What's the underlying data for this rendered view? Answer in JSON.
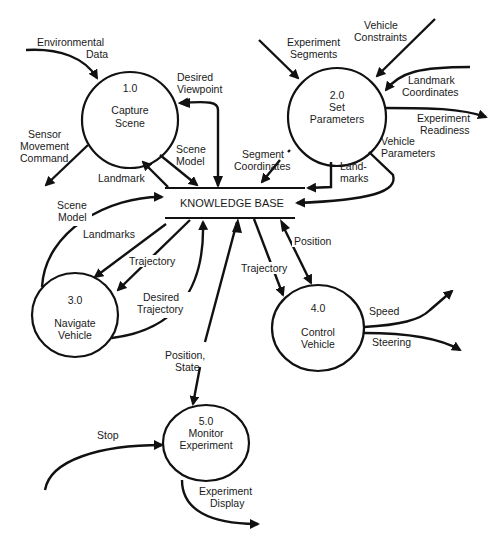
{
  "diagram": {
    "type": "data-flow-diagram",
    "colors": {
      "line": "#111111",
      "background": "#ffffff",
      "text": "#1a1a1a"
    },
    "data_store": {
      "label": "KNOWLEDGE BASE"
    },
    "processes": [
      {
        "id": "1.0",
        "name_line1": "Capture",
        "name_line2": "Scene"
      },
      {
        "id": "2.0",
        "name_line1": "Set",
        "name_line2": "Parameters"
      },
      {
        "id": "3.0",
        "name_line1": "Navigate",
        "name_line2": "Vehicle"
      },
      {
        "id": "4.0",
        "name_line1": "Control",
        "name_line2": "Vehicle"
      },
      {
        "id": "5.0",
        "name_line1": "Monitor",
        "name_line2": "Experiment"
      }
    ],
    "flows": {
      "environmental_data": {
        "l1": "Environmental",
        "l2": "Data"
      },
      "desired_viewpoint": {
        "l1": "Desired",
        "l2": "Viewpoint"
      },
      "sensor_movement_command": {
        "l1": "Sensor",
        "l2": "Movement",
        "l3": "Command"
      },
      "scene_model_1": {
        "l1": "Scene",
        "l2": "Model"
      },
      "landmark": {
        "l1": "Landmark"
      },
      "segment_coordinates": {
        "l1": "Segment",
        "l2": "Coordinates"
      },
      "experiment_segments": {
        "l1": "Experiment",
        "l2": "Segments"
      },
      "vehicle_constraints": {
        "l1": "Vehicle",
        "l2": "Constraints"
      },
      "landmark_coordinates": {
        "l1": "Landmark",
        "l2": "Coordinates"
      },
      "experiment_readiness": {
        "l1": "Experiment",
        "l2": "Readiness"
      },
      "vehicle_parameters": {
        "l1": "Vehicle",
        "l2": "Parameters"
      },
      "landmarks_2": {
        "l1": "Land-",
        "l2": "marks"
      },
      "scene_model_3": {
        "l1": "Scene",
        "l2": "Model"
      },
      "landmarks_3": {
        "l1": "Landmarks"
      },
      "trajectory_3": {
        "l1": "Trajectory"
      },
      "desired_trajectory": {
        "l1": "Desired",
        "l2": "Trajectory"
      },
      "trajectory_4": {
        "l1": "Trajectory"
      },
      "position_4": {
        "l1": "Position"
      },
      "speed": {
        "l1": "Speed"
      },
      "steering": {
        "l1": "Steering"
      },
      "position_state": {
        "l1": "Position,",
        "l2": "State"
      },
      "stop": {
        "l1": "Stop"
      },
      "experiment_display": {
        "l1": "Experiment",
        "l2": "Display"
      }
    }
  }
}
